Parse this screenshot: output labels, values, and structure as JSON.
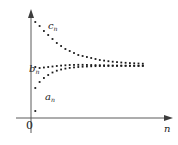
{
  "figure": {
    "title": "",
    "axis": {
      "origin_label": "0",
      "x_axis_label": "n",
      "y_axis_label": ""
    },
    "series_labels": {
      "upper": "c",
      "middle": "b",
      "lower": "a",
      "subscript": "n"
    },
    "colors": {
      "axis": "#555555",
      "point": "#1a1a1a",
      "background": "#ffffff",
      "text": "#262626"
    }
  },
  "chart_data": {
    "type": "scatter",
    "title": "",
    "xlabel": "n",
    "ylabel": "",
    "grid": false,
    "legend": "none",
    "annotations": [
      {
        "text": "c_n",
        "x": 10,
        "y": 86,
        "note": "label for upper decreasing sequence"
      },
      {
        "text": "b_n",
        "x": 3,
        "y": 50,
        "note": "label for middle sequence"
      },
      {
        "text": "a_n",
        "x": 9,
        "y": 24,
        "note": "label for lower increasing sequence"
      },
      {
        "text": "0",
        "x": 0,
        "y": 0,
        "note": "origin label"
      }
    ],
    "xlim": [
      0,
      30
    ],
    "ylim": [
      0,
      100
    ],
    "limit_value": 52,
    "series": [
      {
        "name": "c_n",
        "role": "upper",
        "x": [
          1,
          2,
          3,
          4,
          5,
          6,
          7,
          8,
          9,
          10,
          11,
          12,
          13,
          14,
          15,
          16,
          17,
          18,
          19,
          20,
          21,
          22,
          23,
          24,
          25,
          26
        ],
        "values": [
          96,
          92,
          87,
          83,
          79,
          75,
          72,
          69,
          67,
          65,
          63,
          62,
          61,
          60,
          59,
          58,
          57.4,
          56.8,
          56.3,
          55.9,
          55.5,
          55.2,
          54.9,
          54.7,
          54.5,
          54.3
        ]
      },
      {
        "name": "b_n",
        "role": "middle",
        "x": [
          1,
          2,
          3,
          4,
          5,
          6,
          7,
          8,
          9,
          10,
          11,
          12,
          13,
          14,
          15,
          16,
          17,
          18,
          19,
          20,
          21,
          22,
          23,
          24,
          25,
          26
        ],
        "values": [
          51,
          50,
          50.5,
          51,
          51.5,
          52,
          52.4,
          52.7,
          53,
          53.1,
          53.2,
          53.2,
          53.1,
          53,
          52.9,
          52.8,
          52.7,
          52.6,
          52.5,
          52.45,
          52.4,
          52.35,
          52.3,
          52.25,
          52.2,
          52.2
        ]
      },
      {
        "name": "a_n",
        "role": "lower",
        "x": [
          1,
          2,
          3,
          4,
          5,
          6,
          7,
          8,
          9,
          10,
          11,
          12,
          13,
          14,
          15,
          16,
          17,
          18,
          19,
          20,
          21,
          22,
          23,
          24,
          25,
          26
        ],
        "values": [
          30,
          36,
          40,
          43,
          45.5,
          47.3,
          48.5,
          49.4,
          50.1,
          50.6,
          51,
          51.3,
          51.5,
          51.7,
          51.85,
          51.95,
          52.0,
          52.05,
          52.1,
          52.1,
          52.15,
          52.15,
          52.15,
          52.15,
          52.15,
          52.15
        ]
      },
      {
        "name": "outlier",
        "role": "stray-point",
        "x": [
          1
        ],
        "values": [
          7
        ]
      }
    ]
  }
}
